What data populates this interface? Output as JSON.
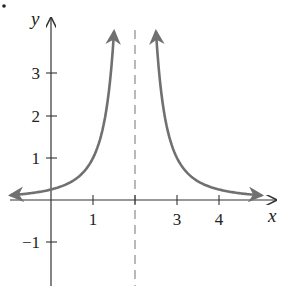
{
  "chart_data": {
    "type": "line",
    "title": "",
    "function": "y = 1/(x-2)^2",
    "xlabel": "x",
    "ylabel": "y",
    "xlim": [
      -1.0,
      5.4
    ],
    "ylim": [
      -2.0,
      4.5
    ],
    "grid": false,
    "legend": null,
    "x_ticks": [
      1,
      2,
      3,
      4
    ],
    "x_tick_labels": [
      "1",
      "",
      "3",
      "4"
    ],
    "y_ticks": [
      -1,
      1,
      2,
      3
    ],
    "y_tick_labels": [
      "−1",
      "1",
      "2",
      "3"
    ],
    "vertical_asymptote": {
      "x": 2,
      "style": "dashed"
    },
    "horizontal_asymptote": {
      "y": 0
    },
    "series": [
      {
        "name": "left branch",
        "x": [
          -0.95,
          -0.5,
          0,
          0.5,
          1,
          1.25,
          1.5
        ],
        "values": [
          0.115,
          0.16,
          0.25,
          0.444,
          1,
          1.778,
          4
        ],
        "arrows": "both"
      },
      {
        "name": "right branch",
        "x": [
          2.5,
          2.75,
          3,
          3.5,
          4,
          4.5,
          5.0
        ],
        "values": [
          4,
          1.778,
          1,
          0.444,
          0.25,
          0.16,
          0.111
        ],
        "arrows": "both"
      }
    ],
    "colors": {
      "curve": "#707070",
      "axes": "#333333",
      "asymptote": "#8a8a8a"
    }
  }
}
